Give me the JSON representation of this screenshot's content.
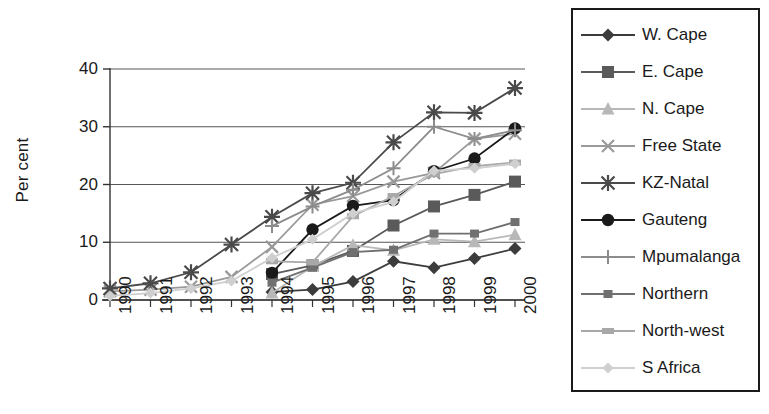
{
  "chart_data": {
    "type": "line",
    "title": "",
    "xlabel": "",
    "ylabel": "Per cent",
    "x": [
      "1990",
      "1991",
      "1992",
      "1993",
      "1994",
      "1995",
      "1996",
      "1997",
      "1998",
      "1999",
      "2000"
    ],
    "categories": [
      "1990",
      "1991",
      "1992",
      "1993",
      "1994",
      "1995",
      "1996",
      "1997",
      "1998",
      "1999",
      "2000"
    ],
    "ylim": [
      0,
      40
    ],
    "yticks": [
      0,
      10,
      20,
      30,
      40
    ],
    "ytick_labels": [
      "0",
      "10",
      "20",
      "30",
      "40"
    ],
    "grid": "horizontal",
    "legend_position": "right",
    "series": [
      {
        "name": "W. Cape",
        "marker": "diamond",
        "color": "#3c3c3c",
        "values": [
          null,
          null,
          null,
          null,
          1.4,
          1.8,
          3.2,
          6.7,
          5.6,
          7.2,
          8.9
        ]
      },
      {
        "name": "E. Cape",
        "marker": "square",
        "color": "#5a5a5a",
        "values": [
          null,
          null,
          null,
          null,
          4.5,
          6.0,
          8.5,
          12.9,
          16.2,
          18.2,
          20.5
        ]
      },
      {
        "name": "N. Cape",
        "marker": "triangle",
        "color": "#b8b8b8",
        "values": [
          null,
          null,
          null,
          null,
          1.2,
          5.8,
          9.5,
          8.6,
          10.5,
          10.1,
          11.3
        ]
      },
      {
        "name": "Free State",
        "marker": "x",
        "color": "#9a9a9a",
        "values": [
          1.5,
          1.8,
          2.3,
          4.0,
          9.2,
          16.5,
          18.0,
          20.5,
          22.0,
          27.9,
          28.8
        ]
      },
      {
        "name": "KZ-Natal",
        "marker": "star",
        "color": "#4a4a4a",
        "values": [
          2.0,
          2.9,
          4.8,
          9.6,
          14.4,
          18.5,
          20.3,
          27.3,
          32.5,
          32.4,
          36.7
        ]
      },
      {
        "name": "Gauteng",
        "marker": "circle",
        "color": "#1a1a1a",
        "values": [
          null,
          null,
          null,
          null,
          4.7,
          12.2,
          16.3,
          17.3,
          22.3,
          24.5,
          29.7
        ]
      },
      {
        "name": "Mpumalanga",
        "marker": "plus",
        "color": "#8c8c8c",
        "values": [
          null,
          null,
          null,
          null,
          12.8,
          16.2,
          19.1,
          22.8,
          30.0,
          27.9,
          29.4
        ]
      },
      {
        "name": "Northern",
        "marker": "small-square",
        "color": "#707070",
        "values": [
          null,
          null,
          null,
          null,
          3.0,
          5.6,
          8.3,
          8.7,
          11.5,
          11.5,
          13.5
        ]
      },
      {
        "name": "North-west",
        "marker": "small-rect",
        "color": "#a8a8a8",
        "values": [
          null,
          null,
          null,
          null,
          6.7,
          6.5,
          14.5,
          18.0,
          21.8,
          23.2,
          23.8
        ]
      },
      {
        "name": "S Africa",
        "marker": "small-diamond",
        "color": "#cfcfcf",
        "values": [
          0.7,
          1.2,
          2.0,
          3.3,
          7.3,
          10.5,
          15.0,
          17.0,
          22.4,
          22.8,
          23.6
        ]
      }
    ]
  },
  "legend": {
    "items": [
      {
        "label": "W. Cape"
      },
      {
        "label": "E. Cape"
      },
      {
        "label": "N. Cape"
      },
      {
        "label": "Free State"
      },
      {
        "label": "KZ-Natal"
      },
      {
        "label": "Gauteng"
      },
      {
        "label": "Mpumalanga"
      },
      {
        "label": "Northern"
      },
      {
        "label": "North-west"
      },
      {
        "label": "S Africa"
      }
    ]
  },
  "axes": {
    "y_title": "Per cent"
  }
}
